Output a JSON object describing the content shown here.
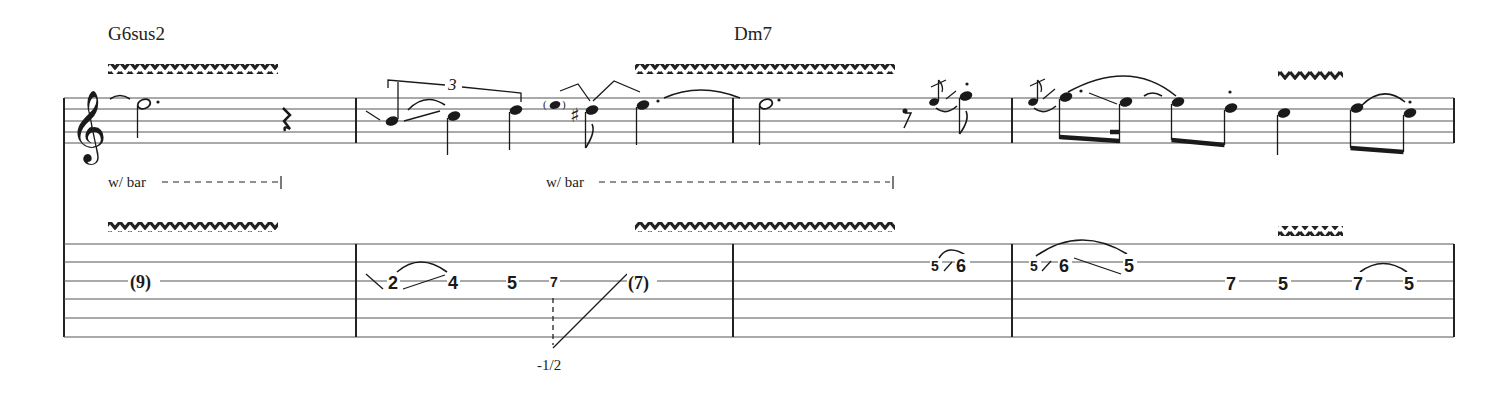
{
  "score": {
    "chords": [
      {
        "name": "G6sus2",
        "x": 108,
        "y": 40
      },
      {
        "name": "Dm7",
        "x": 734,
        "y": 40
      }
    ],
    "clef": "treble",
    "staff": {
      "notation_lines_y": [
        98,
        109,
        121,
        132,
        143
      ],
      "tab_lines_y": [
        244,
        262,
        281,
        299,
        318,
        337
      ],
      "left_x": 64,
      "right_x": 1454,
      "barlines_x": [
        64,
        356,
        733,
        1012,
        1454
      ]
    },
    "vibrato_marks": [
      {
        "staff": "notation",
        "x1": 108,
        "x2": 278
      },
      {
        "staff": "notation",
        "x1": 635,
        "x2": 895
      },
      {
        "staff": "notation",
        "x1": 1278,
        "x2": 1343
      },
      {
        "staff": "tab",
        "x1": 108,
        "x2": 278
      },
      {
        "staff": "tab",
        "x1": 635,
        "x2": 895
      },
      {
        "staff": "tab",
        "x1": 1278,
        "x2": 1343
      }
    ],
    "annotations": {
      "wbar_1": "w/ bar",
      "wbar_2": "w/ bar",
      "triplet": "3",
      "bend_amount": "-1/2"
    },
    "measures": [
      {
        "number": 1,
        "notes": [
          "tie-in",
          "half-dotted C",
          "quarter rest"
        ],
        "tab": [
          {
            "fret": "(9)",
            "string": 3
          }
        ]
      },
      {
        "number": 2,
        "notes": [
          "triplet: A (slide in) - B (hammer) - C",
          "ghost (D)",
          "C# eighth",
          "D dotted quarter (tied)"
        ],
        "tab": [
          {
            "fret": "2",
            "string": 3
          },
          {
            "fret": "4",
            "string": 3
          },
          {
            "fret": "5",
            "string": 3
          },
          {
            "fret": "7",
            "string": 3
          },
          {
            "fret": "(7)",
            "string": 3
          }
        ]
      },
      {
        "number": 3,
        "notes": [
          "D dotted half",
          "eighth rest",
          "grace slide",
          "F eighth staccato"
        ],
        "tab": [
          {
            "fret": "5",
            "string": 2,
            "grace": true
          },
          {
            "fret": "6",
            "string": 2
          }
        ]
      },
      {
        "number": 4,
        "notes": [
          "grace slide",
          "F dotted eighth",
          "E sixteenth",
          "E eighth",
          "D eighth staccato",
          "C quarter",
          "D eighth",
          "C eighth staccato"
        ],
        "tab": [
          {
            "fret": "5",
            "string": 2,
            "grace": true
          },
          {
            "fret": "6",
            "string": 2
          },
          {
            "fret": "5",
            "string": 2
          },
          {
            "fret": "7",
            "string": 3
          },
          {
            "fret": "5",
            "string": 3
          },
          {
            "fret": "7",
            "string": 3
          },
          {
            "fret": "5",
            "string": 3
          }
        ]
      }
    ],
    "tab_labels": {
      "m1_f1": "(9)",
      "m2_f1": "2",
      "m2_f2": "4",
      "m2_f3": "5",
      "m2_f4": "7",
      "m2_f5": "(7)",
      "m3_g1": "5",
      "m3_f1": "6",
      "m4_g1": "5",
      "m4_f1": "6",
      "m4_f2": "5",
      "m4_f3": "7",
      "m4_f4": "5",
      "m4_f5": "7",
      "m4_f6": "5"
    },
    "chord_labels": {
      "c1": "G6sus2",
      "c2": "Dm7"
    }
  }
}
